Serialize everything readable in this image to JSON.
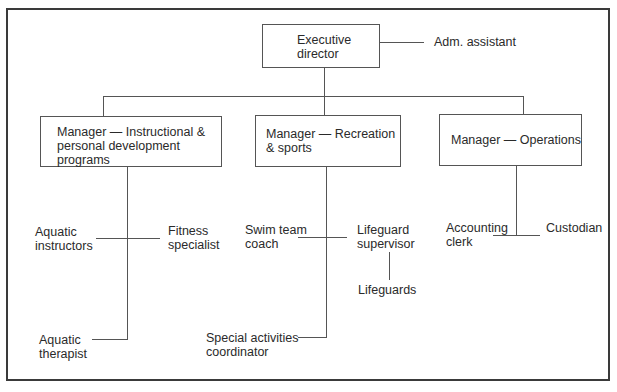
{
  "chart": {
    "type": "org-chart",
    "executive": {
      "line1": "Executive",
      "line2": "director",
      "staff": "Adm. assistant"
    },
    "managers": [
      {
        "line1": "Manager — Instructional &",
        "line2": "personal development",
        "line3": "programs",
        "reports": [
          {
            "line1": "Aquatic",
            "line2": "instructors"
          },
          {
            "line1": "Fitness",
            "line2": "specialist"
          },
          {
            "line1": "Aquatic",
            "line2": "therapist"
          }
        ]
      },
      {
        "line1": "Manager — Recreation",
        "line2": "& sports",
        "reports": [
          {
            "line1": "Swim team",
            "line2": "coach"
          },
          {
            "line1": "Lifeguard",
            "line2": "supervisor",
            "sub": "Lifeguards"
          },
          {
            "line1": "Special activities",
            "line2": "coordinator"
          }
        ]
      },
      {
        "line1": "Manager — Operations",
        "reports": [
          {
            "line1": "Accounting",
            "line2": "clerk"
          },
          {
            "line1": "Custodian"
          }
        ]
      }
    ]
  }
}
